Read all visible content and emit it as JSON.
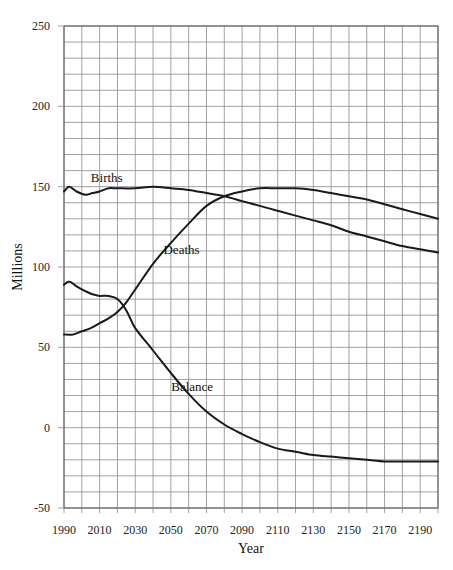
{
  "chart_data": {
    "type": "line",
    "title": "",
    "xlabel": "Year",
    "ylabel": "Millions",
    "xlim": [
      1990,
      2200
    ],
    "ylim": [
      -50,
      250
    ],
    "grid": true,
    "x_grid_step": 10,
    "y_grid_step": 10,
    "x_tick_labels": [
      "1990",
      "2010",
      "2030",
      "2050",
      "2070",
      "2090",
      "2110",
      "2130",
      "2150",
      "2170",
      "2190"
    ],
    "y_tick_labels": [
      "250",
      "200",
      "150",
      "100",
      "50",
      "0",
      "-50"
    ],
    "legend": "inline labels",
    "series": [
      {
        "name": "Births",
        "label_pos": [
          2014,
          153
        ],
        "x": [
          1990,
          1993,
          1997,
          2002,
          2006,
          2010,
          2015,
          2020,
          2030,
          2040,
          2050,
          2060,
          2070,
          2080,
          2090,
          2100,
          2110,
          2120,
          2130,
          2140,
          2150,
          2160,
          2170,
          2180,
          2190,
          2200
        ],
        "values": [
          147,
          150,
          147,
          145,
          146,
          147,
          149,
          149,
          149,
          150,
          149,
          148,
          146,
          144,
          141,
          138,
          135,
          132,
          129,
          126,
          122,
          119,
          116,
          113,
          111,
          109
        ]
      },
      {
        "name": "Deaths",
        "label_pos": [
          2056,
          108
        ],
        "x": [
          1990,
          1995,
          2000,
          2005,
          2010,
          2015,
          2020,
          2025,
          2030,
          2040,
          2050,
          2060,
          2070,
          2080,
          2090,
          2100,
          2110,
          2120,
          2130,
          2140,
          2150,
          2160,
          2170,
          2180,
          2190,
          2200
        ],
        "values": [
          58,
          58,
          60,
          62,
          65,
          68,
          72,
          78,
          86,
          102,
          115,
          127,
          138,
          144,
          147,
          149,
          149,
          149,
          148,
          146,
          144,
          142,
          139,
          136,
          133,
          130
        ]
      },
      {
        "name": "Balance",
        "label_pos": [
          2062,
          23
        ],
        "x": [
          1990,
          1993,
          1997,
          2002,
          2006,
          2010,
          2015,
          2020,
          2025,
          2030,
          2040,
          2050,
          2060,
          2070,
          2080,
          2090,
          2100,
          2110,
          2120,
          2130,
          2140,
          2150,
          2160,
          2170,
          2180,
          2190,
          2200
        ],
        "values": [
          89,
          91,
          88,
          85,
          83,
          82,
          82,
          80,
          73,
          62,
          48,
          34,
          21,
          10,
          2,
          -4,
          -9,
          -13,
          -15,
          -17,
          -18,
          -19,
          -20,
          -21,
          -21,
          -21,
          -21
        ]
      }
    ]
  },
  "layout": {
    "plot_left": 64,
    "plot_right": 438,
    "plot_top": 26,
    "plot_bottom": 508
  }
}
